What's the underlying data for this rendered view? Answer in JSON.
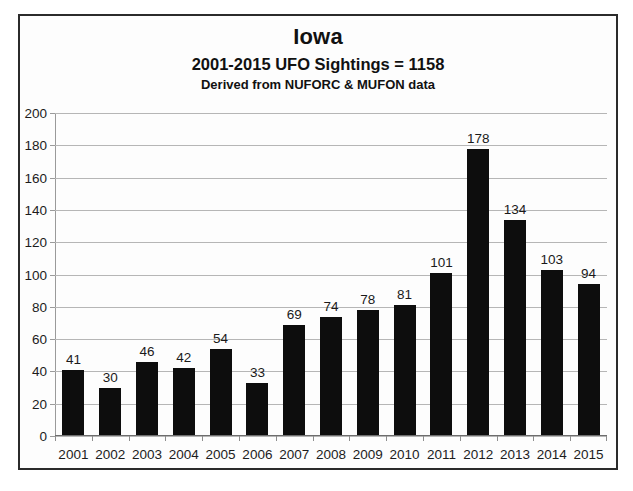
{
  "chart_data": {
    "type": "bar",
    "title": "Iowa",
    "subtitle": "2001-2015  UFO Sightings = 1158",
    "subtitle2": "Derived from NUFORC & MUFON data",
    "xlabel": "",
    "ylabel": "",
    "ylim": [
      0,
      200
    ],
    "ytick_step": 20,
    "grid": true,
    "legend": "none",
    "bar_color": "#0d0d0d",
    "categories": [
      "2001",
      "2002",
      "2003",
      "2004",
      "2005",
      "2006",
      "2007",
      "2008",
      "2009",
      "2010",
      "2011",
      "2012",
      "2013",
      "2014",
      "2015"
    ],
    "values": [
      41,
      30,
      46,
      42,
      54,
      33,
      69,
      74,
      78,
      81,
      101,
      178,
      134,
      103,
      94
    ],
    "ytick_labels": [
      "200",
      "180",
      "160",
      "140",
      "120",
      "100",
      "80",
      "60",
      "40",
      "20",
      "0"
    ],
    "ytick_values": [
      200,
      180,
      160,
      140,
      120,
      100,
      80,
      60,
      40,
      20,
      0
    ],
    "data_labels": [
      "41",
      "30",
      "46",
      "42",
      "54",
      "33",
      "69",
      "74",
      "78",
      "81",
      "101",
      "178",
      "134",
      "103",
      "94"
    ],
    "total": 1158
  }
}
